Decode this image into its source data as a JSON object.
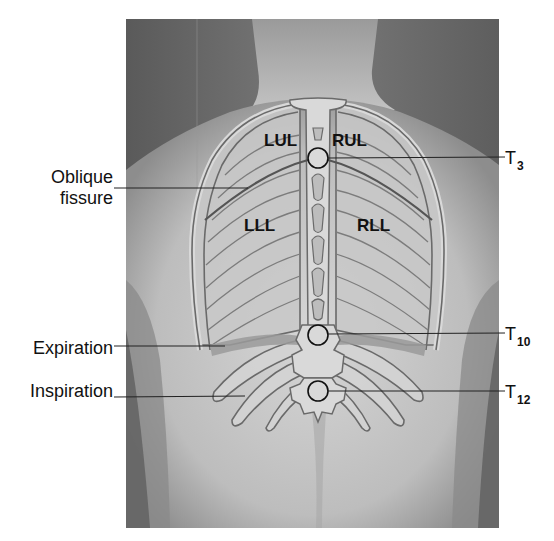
{
  "figure": {
    "photo_bg": "#6e6e6e",
    "skin_light": "#c9c9c9",
    "bone_fill": "#d8d8d8",
    "bone_stroke": "#6a6a6a",
    "marker_stroke": "#111111"
  },
  "lobes": {
    "lul": "LUL",
    "rul": "RUL",
    "lll": "LLL",
    "rll": "RLL"
  },
  "left_labels": {
    "oblique_line1": "Oblique",
    "oblique_line2": "fissure",
    "expiration": "Expiration",
    "inspiration": "Inspiration"
  },
  "right_labels": {
    "t3": {
      "main": "T",
      "sub": "3"
    },
    "t10": {
      "main": "T",
      "sub": "10"
    },
    "t12": {
      "main": "T",
      "sub": "12"
    }
  }
}
